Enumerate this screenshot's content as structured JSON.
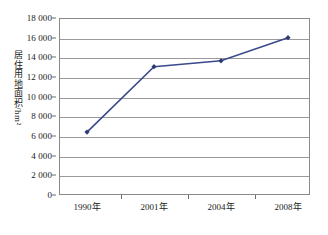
{
  "chart_data": {
    "type": "line",
    "title": "",
    "xlabel": "",
    "ylabel": "居住用地面积/hm²",
    "ylabel_text": "居住用地面积",
    "ylabel_unit": "/hm²",
    "categories": [
      "1990年",
      "2001年",
      "2004年",
      "2008年"
    ],
    "series": [
      {
        "name": "居住用地面积",
        "values": [
          6400,
          13050,
          13650,
          16000
        ],
        "color": "#3b4a8c"
      }
    ],
    "ylim": [
      0,
      18000
    ],
    "ytick_values": [
      0,
      2000,
      4000,
      6000,
      8000,
      10000,
      12000,
      14000,
      16000,
      18000
    ],
    "ytick_labels": [
      "0",
      "2 000",
      "4 000",
      "6 000",
      "8 000",
      "10 000",
      "12 000",
      "14 000",
      "16 000",
      "18 000"
    ],
    "grid": true,
    "grid_axis": "y",
    "legend": false,
    "legend_position": "none",
    "marker": "diamond",
    "line_color": "#3b4a8c",
    "marker_color": "#2e3a73",
    "grid_color": "#9a9a9a",
    "frame_color": "#8a8a8a",
    "background": "#ffffff"
  }
}
